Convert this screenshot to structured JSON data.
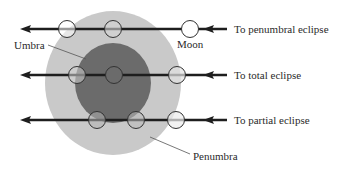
{
  "diagram": {
    "colors": {
      "penumbra": "#c9c9c9",
      "umbra": "#6b6b6b",
      "line": "#1e1e1e",
      "moon_fill": "#ffffff",
      "moon_stroke": "#333333",
      "leader": "#555555"
    },
    "shadow": {
      "penumbra": {
        "label": "Penumbra",
        "cx": 113,
        "cy": 83,
        "rx": 68,
        "ry": 72
      },
      "umbra": {
        "label": "Umbra",
        "cx": 113,
        "cy": 83,
        "rx": 38,
        "ry": 40
      }
    },
    "labels": {
      "umbra": "Umbra",
      "penumbra": "Penumbra",
      "moon": "Moon"
    },
    "paths": [
      {
        "label": "To penumbral eclipse",
        "y": 29,
        "moons_x": [
          67,
          113,
          190
        ]
      },
      {
        "label": "To total eclipse",
        "y": 75,
        "moons_x": [
          77,
          114,
          177
        ]
      },
      {
        "label": "To partial eclipse",
        "y": 120,
        "moons_x": [
          97,
          136,
          176
        ]
      }
    ]
  }
}
